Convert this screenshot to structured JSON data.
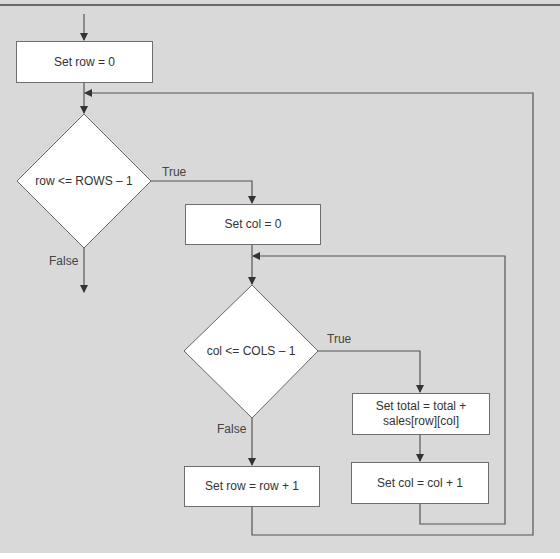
{
  "diagram": {
    "type": "flowchart",
    "nodes": {
      "set_row_0": "Set row = 0",
      "cond_rows": "row <= ROWS – 1",
      "set_col_0": "Set col = 0",
      "cond_cols": "col <= COLS – 1",
      "set_total_line1": "Set total = total +",
      "set_total_line2": "sales[row][col]",
      "inc_row": "Set row = row + 1",
      "inc_col": "Set col = col + 1"
    },
    "labels": {
      "rows_true": "True",
      "rows_false": "False",
      "cols_true": "True",
      "cols_false": "False"
    },
    "colors": {
      "background": "#d9d9d9",
      "box_fill": "#ffffff",
      "line": "#555555"
    }
  }
}
